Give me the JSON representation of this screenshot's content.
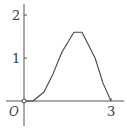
{
  "chart_data": {
    "type": "line",
    "title": "",
    "xlabel": "",
    "ylabel": "",
    "origin_label": "O",
    "x_ticks": [
      {
        "value": 3,
        "label": "3"
      }
    ],
    "y_ticks": [
      {
        "value": 1,
        "label": "1"
      },
      {
        "value": 2,
        "label": "2"
      }
    ],
    "xlim": [
      -0.8,
      3.5
    ],
    "ylim": [
      -0.8,
      2.3
    ],
    "grid": false,
    "legend": null,
    "series": [
      {
        "name": "curve",
        "x": [
          0.31,
          0.69,
          1.0,
          1.31,
          1.72,
          2.0,
          2.45,
          2.72,
          3.0
        ],
        "y": [
          0.0,
          0.21,
          0.63,
          1.14,
          1.6,
          1.6,
          1.0,
          0.42,
          0.0
        ]
      }
    ],
    "colors": {
      "axis": "#555555",
      "curve": "#444444",
      "text": "#3a3a3a"
    }
  }
}
